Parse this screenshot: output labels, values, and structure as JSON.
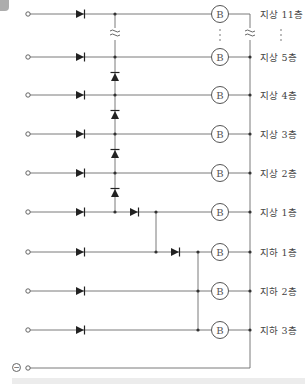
{
  "diagram": {
    "title": "",
    "component_symbols": {
      "lamp_label": "B",
      "break_symbol": "≈",
      "ellipsis": "⋮",
      "negative_terminal": "−"
    },
    "floors": [
      {
        "id": "f11",
        "label": "지상 11층",
        "y": 14
      },
      {
        "id": "f5",
        "label": "지상 5층",
        "y": 57
      },
      {
        "id": "f4",
        "label": "지상 4층",
        "y": 95
      },
      {
        "id": "f3",
        "label": "지상 3층",
        "y": 134
      },
      {
        "id": "f2",
        "label": "지상 2층",
        "y": 173
      },
      {
        "id": "f1",
        "label": "지상 1층",
        "y": 212
      },
      {
        "id": "b1",
        "label": "지하 1층",
        "y": 252
      },
      {
        "id": "b2",
        "label": "지하 2층",
        "y": 291
      },
      {
        "id": "b3",
        "label": "지하 3층",
        "y": 330
      }
    ],
    "common_line": {
      "label": "⊖",
      "y": 368
    },
    "colors": {
      "line": "#6b6b6b",
      "diode": "#222222",
      "lamp_border": "#555555",
      "text": "#444444",
      "background": "#ffffff"
    }
  }
}
